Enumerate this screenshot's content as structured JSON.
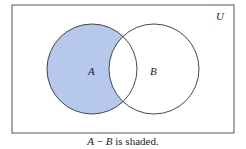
{
  "diagram": {
    "type": "venn",
    "universe_label": "U",
    "sets": [
      {
        "label": "A",
        "shaded": "only-A"
      },
      {
        "label": "B",
        "shaded": "none"
      }
    ],
    "shaded_region": "A − B",
    "colors": {
      "shade": "#b6c8ec",
      "stroke": "#333333",
      "frame": "#555555"
    }
  },
  "caption": {
    "expr_a": "A",
    "op": " − ",
    "expr_b": "B",
    "text": " is shaded."
  }
}
